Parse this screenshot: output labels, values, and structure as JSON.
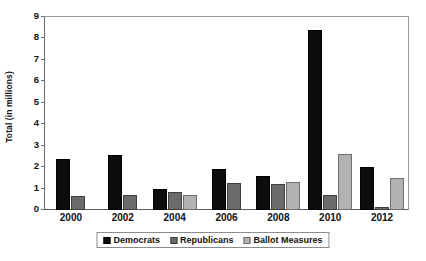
{
  "chart_data": {
    "type": "bar",
    "title": "",
    "subtitle": "",
    "xlabel": "",
    "ylabel": "Total (in millions)",
    "categories": [
      "2000",
      "2002",
      "2004",
      "2006",
      "2008",
      "2010",
      "2012"
    ],
    "series": [
      {
        "name": "Democrats",
        "color": "#0d0d0d",
        "values": [
          2.4,
          2.55,
          1.0,
          1.9,
          1.6,
          8.4,
          2.0
        ]
      },
      {
        "name": "Republicans",
        "color": "#6b6b6b",
        "values": [
          0.65,
          0.7,
          0.85,
          1.25,
          1.2,
          0.7,
          0.12
        ]
      },
      {
        "name": "Ballot Measures",
        "color": "#b2b2b2",
        "values": [
          null,
          null,
          0.7,
          null,
          1.3,
          2.6,
          1.5
        ]
      }
    ],
    "ylim": [
      0,
      9
    ],
    "yticks": [
      0,
      1,
      2,
      3,
      4,
      5,
      6,
      7,
      8,
      9
    ],
    "ytick_labels": [
      "0",
      "1",
      "2",
      "3",
      "4",
      "5",
      "6",
      "7",
      "8",
      "9"
    ],
    "grid": false,
    "legend_position": "bottom",
    "legend_entries": [
      "Democrats",
      "Republicans",
      "Ballot Measures"
    ],
    "annotations": []
  },
  "axes": {
    "y_title": "Total (in millions)"
  },
  "colors": {
    "democrats": "#0d0d0d",
    "republicans": "#6b6b6b",
    "ballot_measures": "#b2b2b2",
    "frame": "#9a9a9a",
    "background": "#ffffff"
  }
}
